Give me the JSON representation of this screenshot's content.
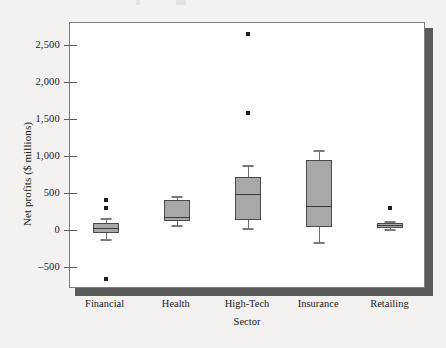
{
  "chart_data": {
    "type": "box",
    "title": "",
    "xlabel": "Sector",
    "ylabel": "Net profits ($ millions)",
    "categories": [
      "Financial",
      "Health",
      "High-Tech",
      "Insurance",
      "Retailing"
    ],
    "ylim": [
      -800,
      2800
    ],
    "yticks": [
      -500,
      0,
      500,
      1000,
      1500,
      2000,
      2500
    ],
    "ytick_labels": [
      "–500",
      "0",
      "500",
      "1,000",
      "1,500",
      "2,000",
      "2,500"
    ],
    "grid": false,
    "legend": "none",
    "colors": {
      "box_fill": "#a8a8a8",
      "box_edge": "#4a4a4a",
      "median": "#3a3a3a",
      "whisker": "#6f6f6f",
      "outlier": "#1d1d1d",
      "plot_background": "#ffffff",
      "page_background": "#f3f2f0",
      "frame": "#7d7d7d",
      "shadow": "#5b5b5b"
    },
    "boxes": [
      {
        "category": "Financial",
        "whisker_low": -130,
        "q1": -40,
        "median": 30,
        "q3": 90,
        "whisker_high": 160,
        "outliers": [
          410,
          300,
          -670
        ]
      },
      {
        "category": "Health",
        "whisker_low": 60,
        "q1": 120,
        "median": 180,
        "q3": 410,
        "whisker_high": 460,
        "outliers": []
      },
      {
        "category": "High-Tech",
        "whisker_low": 20,
        "q1": 130,
        "median": 490,
        "q3": 720,
        "whisker_high": 880,
        "outliers": [
          2650,
          1580
        ]
      },
      {
        "category": "Insurance",
        "whisker_low": -160,
        "q1": 40,
        "median": 320,
        "q3": 950,
        "whisker_high": 1080,
        "outliers": []
      },
      {
        "category": "Retailing",
        "whisker_low": 10,
        "q1": 30,
        "median": 60,
        "q3": 100,
        "whisker_high": 120,
        "outliers": [
          290
        ]
      }
    ]
  }
}
